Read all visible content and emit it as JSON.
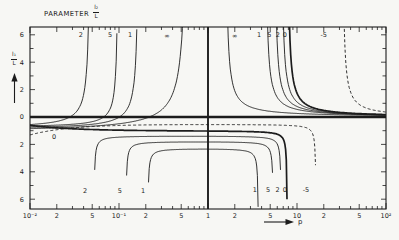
{
  "figure": {
    "title_text": "PARAMETER",
    "title_frac": {
      "top": "l₂",
      "bottom": "L"
    },
    "y_axis_frac": {
      "top": "l₁",
      "bottom": "L"
    },
    "x_axis_label": "p"
  },
  "chart_data": {
    "type": "line",
    "xlabel": "p",
    "ylabel": "l1/L",
    "x_scale": "log",
    "x_range": [
      0.01,
      100
    ],
    "y_range": [
      -6.6,
      6.6
    ],
    "grid": false,
    "stroke_color": "#1c1c1c",
    "background": "#f7f7f4",
    "layout": {
      "x0": 30,
      "x1": 386,
      "y0": 27,
      "y1": 209,
      "zeroY": 117,
      "unit": 13.7,
      "decade": 89,
      "lmin": -2,
      "lmax": 2,
      "center_l": 0,
      "frame_w": 1.1,
      "zero_line_w": 2.6,
      "center_line_w": 1.9,
      "curve_w": 0.9,
      "heavy_w": 1.7,
      "dash": "3,2.2"
    },
    "x_tick_labels": [
      {
        "text": "10⁻²",
        "l": -2
      },
      {
        "text": "2",
        "l": -1.699
      },
      {
        "text": "5",
        "l": -1.301
      },
      {
        "text": "10⁻¹",
        "l": -1
      },
      {
        "text": "2",
        "l": -0.699
      },
      {
        "text": "5",
        "l": -0.301
      },
      {
        "text": "1",
        "l": 0
      },
      {
        "text": "2",
        "l": 0.301
      },
      {
        "text": "5",
        "l": 0.699
      },
      {
        "text": "10",
        "l": 1
      },
      {
        "text": "2",
        "l": 1.301
      },
      {
        "text": "5",
        "l": 1.699
      },
      {
        "text": "10²",
        "l": 2
      }
    ],
    "y_tick_labels": [
      {
        "text": "6",
        "v": 6
      },
      {
        "text": "4",
        "v": 4
      },
      {
        "text": "2",
        "v": 2
      },
      {
        "text": "0",
        "v": 0
      },
      {
        "text": "2",
        "v": -2
      },
      {
        "text": "4",
        "v": -4
      },
      {
        "text": "6",
        "v": -6
      }
    ],
    "series": [
      {
        "name": "left-rise",
        "kind": "rise",
        "curves": [
          {
            "label": "2",
            "la": -1.318,
            "C": 0.197,
            "D": 0.84
          },
          {
            "label": "5",
            "la": -1.005,
            "C": 0.131,
            "D": 0.782
          },
          {
            "label": "1",
            "la": -0.772,
            "C": 0.205,
            "D": 0.917
          },
          {
            "label": "∞",
            "la": -0.223,
            "C": 0.493,
            "D": 1.127
          }
        ]
      },
      {
        "name": "right-fall",
        "kind": "fall",
        "curves": [
          {
            "label": "∞",
            "lb": 0.191,
            "C": 0.21
          },
          {
            "label": "1",
            "lb": 0.639,
            "C": 0.2
          },
          {
            "label": "5",
            "lb": 0.74,
            "C": 0.2
          },
          {
            "label": "2",
            "lb": 0.818,
            "C": 0.2
          },
          {
            "label": "0",
            "lb": 0.885,
            "C": 0.2,
            "heavy": true
          },
          {
            "label": "-5",
            "lb": 1.503,
            "C": 0.18,
            "dashed": true
          }
        ]
      },
      {
        "name": "lower-dome",
        "kind": "dome",
        "curves": [
          {
            "label": "2",
            "lL": -1.285,
            "lR": 0.827,
            "P": 1.35
          },
          {
            "label": "5",
            "lL": -0.927,
            "lR": 0.738,
            "P": 1.75
          },
          {
            "label": "1",
            "lL": -0.681,
            "lR": 0.57,
            "P": 2.25
          }
        ]
      },
      {
        "name": "lower-flat",
        "kind": "flat",
        "curves": [
          {
            "label": "0",
            "E": 0.6,
            "P": 1.0,
            "tau": 0.5,
            "lR": 0.894,
            "heavy": true
          },
          {
            "label": "-5",
            "E": 1.3,
            "P": 0.52,
            "tau": 0.45,
            "lR": 1.218,
            "dashed": true
          }
        ]
      }
    ],
    "curve_labels": [
      {
        "text": "2",
        "l": -1.43,
        "v": 6.0
      },
      {
        "text": "5",
        "l": -1.1,
        "v": 6.0
      },
      {
        "text": "1",
        "l": -0.875,
        "v": 6.0
      },
      {
        "text": "∞",
        "l": -0.46,
        "v": 5.95
      },
      {
        "text": "∞",
        "l": 0.3,
        "v": 5.95
      },
      {
        "text": "1",
        "l": 0.575,
        "v": 6.0
      },
      {
        "text": "5",
        "l": 0.69,
        "v": 6.0
      },
      {
        "text": "2",
        "l": 0.785,
        "v": 6.0
      },
      {
        "text": "0",
        "l": 0.862,
        "v": 6.0
      },
      {
        "text": "-5",
        "l": 1.3,
        "v": 6.0
      },
      {
        "text": "2",
        "l": -1.38,
        "v": -5.35
      },
      {
        "text": "5",
        "l": -0.99,
        "v": -5.35
      },
      {
        "text": "1",
        "l": -0.73,
        "v": -5.35
      },
      {
        "text": "1",
        "l": 0.525,
        "v": -5.3
      },
      {
        "text": "5",
        "l": 0.675,
        "v": -5.3
      },
      {
        "text": "2",
        "l": 0.782,
        "v": -5.3
      },
      {
        "text": "0",
        "l": 0.862,
        "v": -5.3
      },
      {
        "text": "-5",
        "l": 1.1,
        "v": -5.3
      },
      {
        "text": "0",
        "l": -1.73,
        "v": -1.45
      }
    ]
  }
}
